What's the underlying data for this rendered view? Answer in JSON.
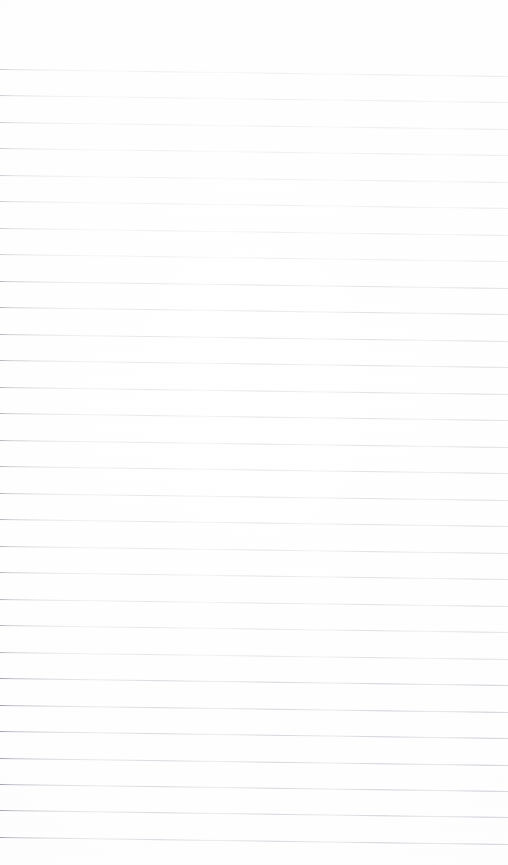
{
  "document": {
    "kind": "lined-paper-scan",
    "content_text": "",
    "writing_present": "none",
    "page_width_px": 508,
    "page_height_px": 865
  },
  "appearance": {
    "background_color": "#fefefe",
    "rule_color": "#d8d8dc",
    "rule_color_dark_segment": "#b0b0b8",
    "rule_thickness_px": 1,
    "rule_slant_degrees": 0.8,
    "rule_spacing_px": 26.5,
    "first_rule_y_px": 73,
    "last_rule_y_px": 840,
    "top_margin_px": 66,
    "left_margin_rule": "none",
    "rule_start_x_px": 0,
    "rule_end_x_px": 508
  },
  "rules": [
    {
      "index": 1,
      "y": 73,
      "weight": "light"
    },
    {
      "index": 2,
      "y": 99,
      "weight": "light"
    },
    {
      "index": 3,
      "y": 126,
      "weight": "light"
    },
    {
      "index": 4,
      "y": 152,
      "weight": "light"
    },
    {
      "index": 5,
      "y": 179,
      "weight": "light"
    },
    {
      "index": 6,
      "y": 205,
      "weight": "light"
    },
    {
      "index": 7,
      "y": 232,
      "weight": "light"
    },
    {
      "index": 8,
      "y": 258,
      "weight": "light"
    },
    {
      "index": 9,
      "y": 285,
      "weight": "normal"
    },
    {
      "index": 10,
      "y": 311,
      "weight": "normal"
    },
    {
      "index": 11,
      "y": 338,
      "weight": "normal"
    },
    {
      "index": 12,
      "y": 364,
      "weight": "normal"
    },
    {
      "index": 13,
      "y": 391,
      "weight": "normal"
    },
    {
      "index": 14,
      "y": 417,
      "weight": "normal"
    },
    {
      "index": 15,
      "y": 444,
      "weight": "normal"
    },
    {
      "index": 16,
      "y": 470,
      "weight": "normal"
    },
    {
      "index": 17,
      "y": 497,
      "weight": "normal"
    },
    {
      "index": 18,
      "y": 523,
      "weight": "normal"
    },
    {
      "index": 19,
      "y": 550,
      "weight": "normal"
    },
    {
      "index": 20,
      "y": 576,
      "weight": "normal"
    },
    {
      "index": 21,
      "y": 603,
      "weight": "normal"
    },
    {
      "index": 22,
      "y": 629,
      "weight": "normal"
    },
    {
      "index": 23,
      "y": 656,
      "weight": "normal"
    },
    {
      "index": 24,
      "y": 682,
      "weight": "dense"
    },
    {
      "index": 25,
      "y": 709,
      "weight": "dense"
    },
    {
      "index": 26,
      "y": 735,
      "weight": "dense"
    },
    {
      "index": 27,
      "y": 762,
      "weight": "dense"
    },
    {
      "index": 28,
      "y": 788,
      "weight": "dense"
    },
    {
      "index": 29,
      "y": 814,
      "weight": "dense"
    },
    {
      "index": 30,
      "y": 841,
      "weight": "dense"
    }
  ]
}
